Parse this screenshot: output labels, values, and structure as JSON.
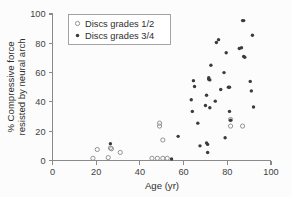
{
  "chart_data": {
    "type": "scatter",
    "title": "",
    "xlabel": "Age (yr)",
    "ylabel": "% Compressive force resisted by neural arch",
    "ylabel_line1": "% Compressive force",
    "ylabel_line2": "resisted by neural arch",
    "xlim": [
      0,
      100
    ],
    "ylim": [
      0,
      100
    ],
    "xticks": [
      0,
      20,
      40,
      60,
      80,
      100
    ],
    "yticks": [
      0,
      20,
      40,
      60,
      80,
      100
    ],
    "xtick_labels": [
      "0",
      "20",
      "40",
      "60",
      "80",
      "100"
    ],
    "ytick_labels": [
      "0",
      "20",
      "40",
      "60",
      "80",
      "100"
    ],
    "grid": false,
    "legend_position": "top-left",
    "series": [
      {
        "name": "Discs grades 1/2",
        "marker": "open-circle",
        "color": "#8d8d8d",
        "points": [
          [
            18.5,
            1.5
          ],
          [
            20.5,
            7.5
          ],
          [
            25.5,
            2.0
          ],
          [
            26.5,
            8.5
          ],
          [
            27.0,
            8.0
          ],
          [
            31.0,
            5.5
          ],
          [
            45.5,
            1.5
          ],
          [
            48.0,
            1.5
          ],
          [
            49.0,
            23.5
          ],
          [
            49.0,
            25.5
          ],
          [
            50.5,
            1.5
          ],
          [
            50.5,
            14.0
          ],
          [
            52.5,
            1.5
          ],
          [
            81.5,
            23.5
          ],
          [
            81.5,
            28.0
          ],
          [
            87.0,
            23.5
          ]
        ]
      },
      {
        "name": "Discs grades 3/4",
        "marker": "filled-circle",
        "color": "#3b3b3b",
        "points": [
          [
            26.5,
            11.5
          ],
          [
            54.5,
            1.0
          ],
          [
            57.5,
            16.5
          ],
          [
            63.5,
            41.5
          ],
          [
            64.0,
            33.5
          ],
          [
            64.5,
            54.5
          ],
          [
            65.0,
            50.5
          ],
          [
            66.5,
            25.5
          ],
          [
            67.5,
            10.0
          ],
          [
            70.0,
            37.5
          ],
          [
            70.5,
            44.5
          ],
          [
            70.5,
            12.0
          ],
          [
            71.0,
            11.0
          ],
          [
            71.0,
            5.5
          ],
          [
            71.5,
            55.5
          ],
          [
            71.5,
            56.5
          ],
          [
            72.0,
            55.0
          ],
          [
            72.0,
            36.0
          ],
          [
            72.5,
            65.0
          ],
          [
            74.5,
            40.5
          ],
          [
            75.0,
            80.5
          ],
          [
            76.0,
            82.5
          ],
          [
            77.0,
            48.5
          ],
          [
            78.5,
            60.0
          ],
          [
            79.0,
            15.5
          ],
          [
            79.5,
            73.5
          ],
          [
            80.5,
            50.0
          ],
          [
            81.0,
            50.0
          ],
          [
            81.0,
            33.5
          ],
          [
            81.5,
            27.5
          ],
          [
            85.5,
            76.5
          ],
          [
            86.5,
            77.0
          ],
          [
            87.0,
            95.5
          ],
          [
            87.5,
            95.5
          ],
          [
            87.5,
            71.0
          ],
          [
            88.0,
            70.5
          ],
          [
            90.5,
            54.0
          ],
          [
            91.0,
            47.5
          ],
          [
            91.5,
            85.5
          ],
          [
            92.0,
            36.5
          ]
        ]
      }
    ]
  },
  "legend": {
    "entries": [
      {
        "label": "Discs grades 1/2",
        "marker": "open-circle"
      },
      {
        "label": "Discs grades 3/4",
        "marker": "filled-circle"
      }
    ]
  },
  "axes": {
    "x_title": "Age (yr)",
    "y_title_line1": "% Compressive force",
    "y_title_line2": "resisted by neural arch"
  },
  "colors": {
    "background": "#fcfcfc",
    "axis": "#8a8a8a",
    "text": "#2e2e2e",
    "open_marker": "#8d8d8d",
    "filled_marker": "#3b3b3b"
  }
}
